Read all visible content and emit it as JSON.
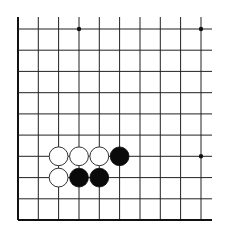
{
  "board": {
    "description": "Go board diagram, bottom-left corner section",
    "columns": 10,
    "rows": 10,
    "edges": {
      "left": true,
      "bottom": true,
      "top": false,
      "right": false
    },
    "grid": {
      "x_lines": [
        18,
        38.3,
        58.6,
        79,
        99.3,
        119.6,
        140,
        160.3,
        180.6,
        201
      ],
      "y_lines": [
        29,
        50.2,
        71.4,
        92.7,
        113.9,
        135.1,
        156.3,
        177.6,
        198.8,
        220
      ],
      "top_extend": 17,
      "right_extend": 212
    },
    "colors": {
      "line": "#222222",
      "edge": "#111111",
      "black_stone": "#0a0a0a",
      "white_stone_fill": "#ffffff",
      "white_stone_stroke": "#333333",
      "background": "#ffffff"
    },
    "stone_radius": 9.4,
    "star_points": [
      {
        "col": 3,
        "row": 0
      },
      {
        "col": 9,
        "row": 0
      },
      {
        "col": 9,
        "row": 6
      }
    ],
    "stones": [
      {
        "color": "white",
        "col": 2,
        "row": 6
      },
      {
        "color": "white",
        "col": 3,
        "row": 6
      },
      {
        "color": "white",
        "col": 4,
        "row": 6
      },
      {
        "color": "black",
        "col": 5,
        "row": 6
      },
      {
        "color": "white",
        "col": 2,
        "row": 7
      },
      {
        "color": "black",
        "col": 3,
        "row": 7
      },
      {
        "color": "black",
        "col": 4,
        "row": 7
      }
    ]
  }
}
